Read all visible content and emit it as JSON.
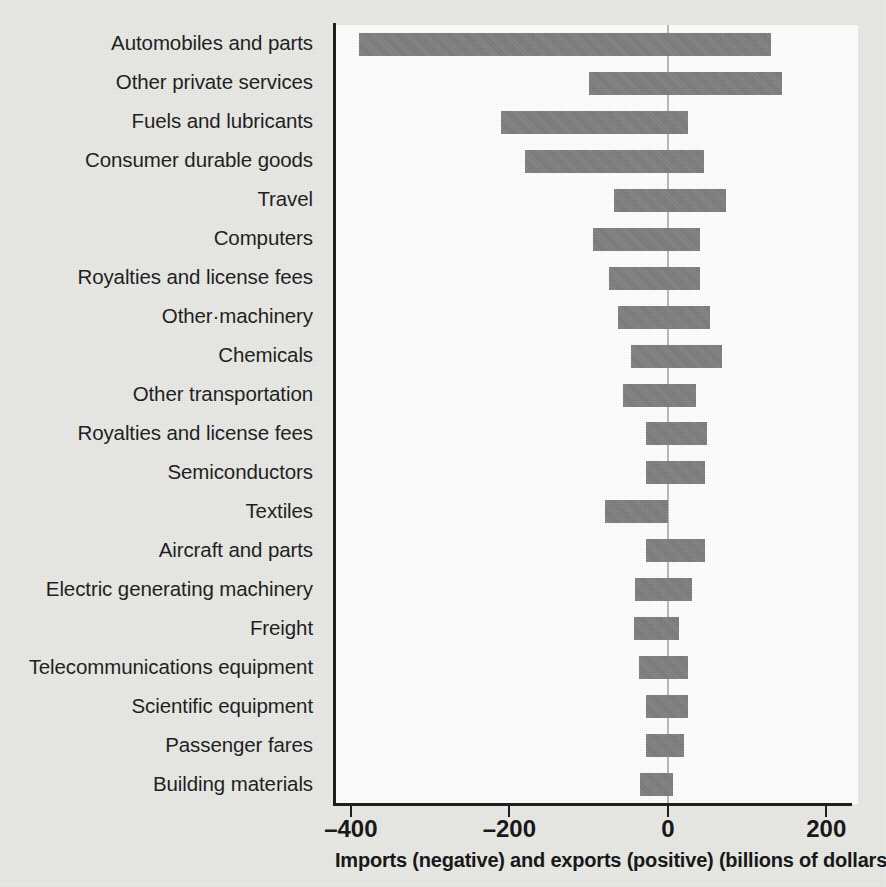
{
  "chart_data": {
    "type": "bar",
    "orientation": "horizontal",
    "title": "",
    "xlabel": "Imports (negative) and exports (positive) (billions of dollars)",
    "ylabel": "",
    "xlim": [
      -420,
      240
    ],
    "xticks": [
      -400,
      -200,
      0,
      200
    ],
    "xticklabels": [
      "–400",
      "–200",
      "0",
      "200"
    ],
    "grid": false,
    "legend": null,
    "zero_reference_line": true,
    "bar_color": "#7e7e7e",
    "plot_background": "#ffffff",
    "page_background": "#e9e9e6",
    "units": "billions of dollars",
    "categories": [
      "Automobiles and parts",
      "Other private services",
      "Fuels and lubricants",
      "Consumer durable goods",
      "Travel",
      "Computers",
      "Royalties and license fees",
      "Other·machinery",
      "Chemicals",
      "Other transportation",
      "Royalties and license fees",
      "Semiconductors",
      "Textiles",
      "Aircraft and parts",
      "Electric generating machinery",
      "Freight",
      "Telecommunications equipment",
      "Scientific equipment",
      "Passenger fares",
      "Building materials"
    ],
    "series": [
      {
        "name": "Imports (negative)",
        "values": [
          -390,
          -99,
          -211,
          -180,
          -68,
          -95,
          -74,
          -63,
          -46,
          -57,
          -27,
          -28,
          -79,
          -28,
          -42,
          -43,
          -36,
          -27,
          -28,
          -35
        ]
      },
      {
        "name": "Exports (positive)",
        "values": [
          130,
          144,
          25,
          46,
          74,
          41,
          41,
          53,
          68,
          36,
          49,
          47,
          0,
          47,
          30,
          14,
          26,
          26,
          20,
          6
        ]
      }
    ]
  }
}
